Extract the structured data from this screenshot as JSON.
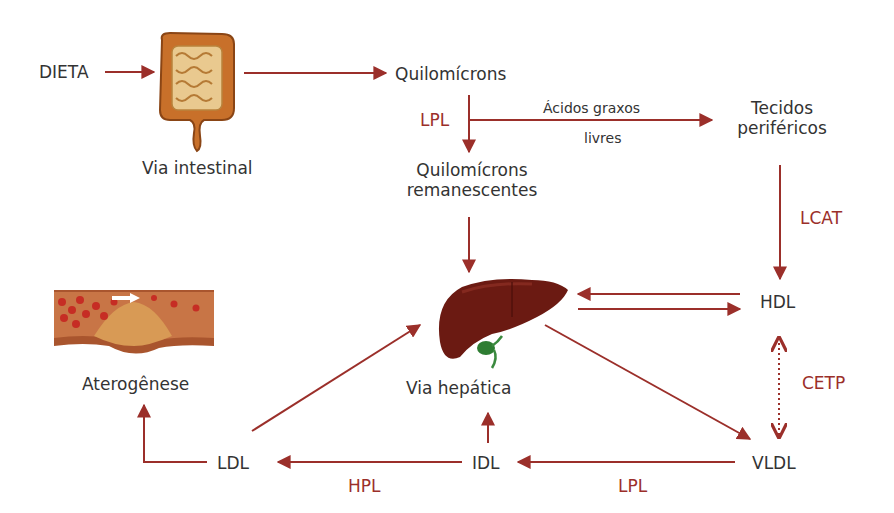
{
  "colors": {
    "arrow": "#9b2f2a",
    "text": "#333333",
    "enzyme": "#9b2f2a",
    "liver": "#6b1a12",
    "gallbladder": "#2e7d32",
    "intestine": "#c8702a",
    "plaque": "#d89a55"
  },
  "nodes": {
    "dieta": "DIETA",
    "via_intestinal": "Via intestinal",
    "quilomicrons": "Quilomícrons",
    "quilomicrons_rem_1": "Quilomícrons",
    "quilomicrons_rem_2": "remanescentes",
    "tecidos_1": "Tecidos",
    "tecidos_2": "periféricos",
    "hdl": "HDL",
    "vldl": "VLDL",
    "idl": "IDL",
    "ldl": "LDL",
    "via_hepatica": "Via hepática",
    "aterogenese": "Aterogênese"
  },
  "edge_labels": {
    "acidos_1": "Ácidos graxos",
    "acidos_2": "livres"
  },
  "enzymes": {
    "lpl_top": "LPL",
    "lcat": "LCAT",
    "cetp": "CETP",
    "hpl": "HPL",
    "lpl_bottom": "LPL"
  },
  "icons": {
    "intestine": "intestine-illustration",
    "liver": "liver-illustration",
    "artery": "artery-plaque-illustration"
  }
}
